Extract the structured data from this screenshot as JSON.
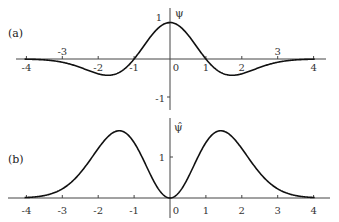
{
  "chart_data": [
    {
      "type": "line",
      "panel_label": "(a)",
      "title": "",
      "xlabel": "",
      "ylabel": "ψ",
      "xlim": [
        -4.2,
        4.3
      ],
      "ylim": [
        -1.1,
        1.1
      ],
      "grid": false,
      "x_ticks": [
        "-4",
        "-3",
        "-2",
        "-1",
        "0",
        "1",
        "2",
        "3",
        "4"
      ],
      "y_ticks": [
        "1",
        "-1"
      ],
      "series": [
        {
          "name": "ψ(t) = (1 - t²) e^{-t²/2}",
          "x": [
            -4,
            -3.5,
            -3,
            -2.5,
            -2,
            -1.73,
            -1.5,
            -1,
            -0.5,
            0,
            0.5,
            1,
            1.5,
            1.73,
            2,
            2.5,
            3,
            3.5,
            4
          ],
          "values": [
            -0.005,
            -0.025,
            -0.089,
            -0.229,
            -0.406,
            -0.446,
            -0.405,
            0.0,
            0.662,
            1.0,
            0.662,
            0.0,
            -0.405,
            -0.446,
            -0.406,
            -0.229,
            -0.089,
            -0.025,
            -0.005
          ]
        }
      ]
    },
    {
      "type": "line",
      "panel_label": "(b)",
      "title": "",
      "xlabel": "",
      "ylabel": "ψ̂",
      "xlim": [
        -4.2,
        4.3
      ],
      "ylim": [
        0,
        1.8
      ],
      "grid": false,
      "x_ticks": [
        "-4",
        "-3",
        "-2",
        "-1",
        "0",
        "1",
        "2",
        "3",
        "4"
      ],
      "y_ticks": [
        "1"
      ],
      "series": [
        {
          "name": "ψ̂(ω) ∝ ω² e^{-ω²/2}",
          "x": [
            -4,
            -3.5,
            -3,
            -2.5,
            -2,
            -1.41,
            -1,
            -0.5,
            0,
            0.5,
            1,
            1.41,
            2,
            2.5,
            3,
            3.5,
            4
          ],
          "values": [
            0.012,
            0.059,
            0.222,
            0.612,
            1.207,
            1.64,
            1.353,
            0.492,
            0.0,
            0.492,
            1.353,
            1.64,
            1.207,
            0.612,
            0.222,
            0.059,
            0.012
          ]
        }
      ]
    }
  ],
  "panels": {
    "a": {
      "label": "(a)",
      "ylabel": "ψ",
      "x_tick_labels": [
        "-4",
        "-3",
        "-2",
        "-1",
        "0",
        "1",
        "2",
        "3",
        "4"
      ],
      "y_tick_labels": {
        "pos": "1",
        "neg": "-1"
      }
    },
    "b": {
      "label": "(b)",
      "ylabel": "ψ̂",
      "x_tick_labels": [
        "-4",
        "-3",
        "-2",
        "-1",
        "0",
        "1",
        "2",
        "3",
        "4"
      ],
      "y_tick_labels": {
        "pos": "1"
      }
    }
  },
  "style": {
    "curve_color": "#111111",
    "axis_color": "#444444"
  }
}
